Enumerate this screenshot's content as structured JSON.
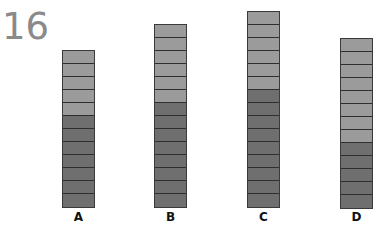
{
  "question_number": "16",
  "colors": {
    "light": "#9b9b9b",
    "dark": "#6f6f6f",
    "line": "#2f2f2f"
  },
  "columns": [
    {
      "label": "A",
      "light_segments": 5,
      "dark_segments": 7,
      "left": 62,
      "top": 50
    },
    {
      "label": "B",
      "light_segments": 6,
      "dark_segments": 8,
      "left": 154,
      "top": 24
    },
    {
      "label": "C",
      "light_segments": 6,
      "dark_segments": 9,
      "left": 247,
      "top": 11
    },
    {
      "label": "D",
      "light_segments": 8,
      "dark_segments": 5,
      "left": 340,
      "top": 38
    }
  ]
}
